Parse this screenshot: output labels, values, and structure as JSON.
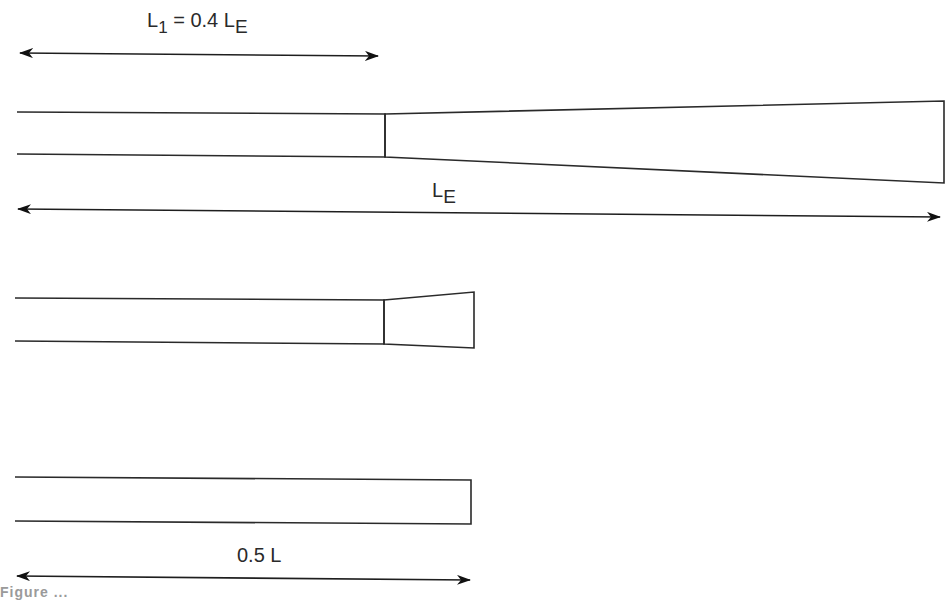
{
  "diagram": {
    "stroke_color": "#2a2a2a",
    "background": "#ffffff",
    "dimensions": [
      {
        "id": "l1",
        "label_main": "L",
        "label_sub1": "1",
        "label_mid": " = 0.4 L",
        "label_sub2": "E"
      },
      {
        "id": "le",
        "label_main": "L",
        "label_sub": "E"
      },
      {
        "id": "half",
        "label": "0.5 L"
      }
    ],
    "shapes": [
      {
        "id": "shape-long-taper",
        "description": "Uniform section of length 0.4 L_E followed by long flared taper to L_E"
      },
      {
        "id": "shape-short-taper",
        "description": "Uniform section followed by short flared taper"
      },
      {
        "id": "shape-uniform",
        "description": "Uniform rectangular section of length 0.5 L"
      }
    ],
    "caption_partial": "Figure ..."
  }
}
